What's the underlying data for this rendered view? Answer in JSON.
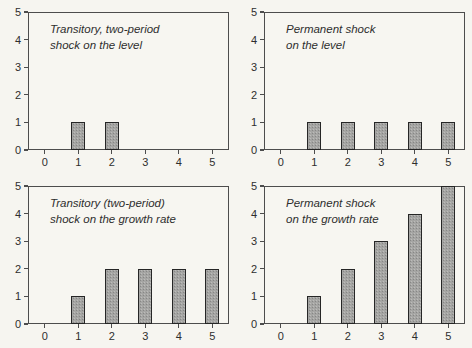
{
  "figure": {
    "background_color": "#f6f5f0",
    "frame_color": "#4d4d4d",
    "bar_fill_color": "#a5a5a3",
    "bar_border_color": "#262626",
    "text_color": "#2e2e2e"
  },
  "chart_data": [
    {
      "type": "bar",
      "title": "Transitory, two-period shock on the level",
      "title_lines": [
        "Transitory, two-period",
        "shock on the level"
      ],
      "categories": [
        "0",
        "1",
        "2",
        "3",
        "4",
        "5"
      ],
      "values": [
        0,
        1,
        1,
        0,
        0,
        0
      ],
      "xlabel": "",
      "ylabel": "",
      "ylim": [
        0,
        5
      ],
      "yticks": [
        0,
        1,
        2,
        3,
        4,
        5
      ],
      "grid": false,
      "legend": "none"
    },
    {
      "type": "bar",
      "title": "Permanent shock on the level",
      "title_lines": [
        "Permanent shock",
        "on the level"
      ],
      "categories": [
        "0",
        "1",
        "2",
        "3",
        "4",
        "5"
      ],
      "values": [
        0,
        1,
        1,
        1,
        1,
        1
      ],
      "xlabel": "",
      "ylabel": "",
      "ylim": [
        0,
        5
      ],
      "yticks": [
        0,
        1,
        2,
        3,
        4,
        5
      ],
      "grid": false,
      "legend": "none"
    },
    {
      "type": "bar",
      "title": "Transitory (two-period) shock on the growth rate",
      "title_lines": [
        "Transitory (two-period)",
        "shock on the growth rate"
      ],
      "categories": [
        "0",
        "1",
        "2",
        "3",
        "4",
        "5"
      ],
      "values": [
        0,
        1,
        2,
        2,
        2,
        2
      ],
      "xlabel": "",
      "ylabel": "",
      "ylim": [
        0,
        5
      ],
      "yticks": [
        0,
        1,
        2,
        3,
        4,
        5
      ],
      "grid": false,
      "legend": "none"
    },
    {
      "type": "bar",
      "title": "Permanent shock on the growth rate",
      "title_lines": [
        "Permanent shock",
        "on the growth rate"
      ],
      "categories": [
        "0",
        "1",
        "2",
        "3",
        "4",
        "5"
      ],
      "values": [
        0,
        1,
        2,
        3,
        4,
        5
      ],
      "xlabel": "",
      "ylabel": "",
      "ylim": [
        0,
        5
      ],
      "yticks": [
        0,
        1,
        2,
        3,
        4,
        5
      ],
      "grid": false,
      "legend": "none"
    }
  ]
}
